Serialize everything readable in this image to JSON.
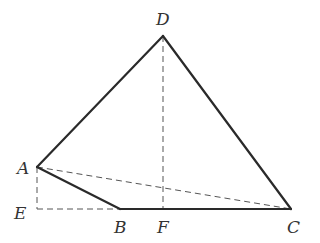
{
  "diagram": {
    "type": "geometry",
    "points": {
      "A": {
        "label": "A",
        "x": 37,
        "y": 167,
        "lx": 17,
        "ly": 174
      },
      "B": {
        "label": "B",
        "x": 120,
        "y": 209,
        "lx": 114,
        "ly": 233
      },
      "C": {
        "label": "C",
        "x": 291,
        "y": 209,
        "lx": 287,
        "ly": 233
      },
      "D": {
        "label": "D",
        "x": 163,
        "y": 36,
        "lx": 156,
        "ly": 25
      },
      "E": {
        "label": "E",
        "x": 37,
        "y": 209,
        "lx": 14,
        "ly": 219
      },
      "F": {
        "label": "F",
        "x": 163,
        "y": 209,
        "lx": 157,
        "ly": 233
      }
    },
    "solid_segments": [
      [
        "A",
        "D"
      ],
      [
        "D",
        "C"
      ],
      [
        "A",
        "B"
      ],
      [
        "B",
        "C"
      ]
    ],
    "dashed_segments": [
      [
        "D",
        "F"
      ],
      [
        "A",
        "C"
      ],
      [
        "A",
        "E"
      ],
      [
        "E",
        "B"
      ]
    ],
    "colors": {
      "stroke": "#2a2a2a",
      "dashed": "#555555",
      "label": "#333333",
      "background": "#ffffff"
    }
  }
}
